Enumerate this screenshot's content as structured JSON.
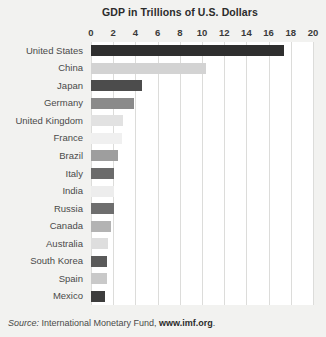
{
  "chart": {
    "title": "GDP in Trillions of U.S. Dollars",
    "source_prefix": "Source:",
    "source_text": " International Monetary Fund, ",
    "source_url": "www.imf.org",
    "source_suffix": "."
  },
  "chart_data": {
    "type": "bar",
    "orientation": "horizontal",
    "title": "GDP in Trillions of U.S. Dollars",
    "xlabel": "",
    "ylabel": "",
    "xlim": [
      0,
      20
    ],
    "xticks": [
      0,
      2,
      4,
      6,
      8,
      10,
      12,
      14,
      16,
      18,
      20
    ],
    "grid": true,
    "legend": "none",
    "unit": "Trillions of U.S. Dollars",
    "categories": [
      "United States",
      "China",
      "Japan",
      "Germany",
      "United Kingdom",
      "France",
      "Brazil",
      "Italy",
      "India",
      "Russia",
      "Canada",
      "Australia",
      "South Korea",
      "Spain",
      "Mexico"
    ],
    "values": [
      17.4,
      10.4,
      4.6,
      3.9,
      2.9,
      2.8,
      2.4,
      2.1,
      2.1,
      2.1,
      1.8,
      1.5,
      1.4,
      1.4,
      1.3
    ],
    "bar_colors": [
      "#2f2f2f",
      "#d3d3d3",
      "#4c4c4c",
      "#8a8a8a",
      "#e2e2e2",
      "#f0f0f0",
      "#9e9e9e",
      "#6b6b6b",
      "#ededed",
      "#6e6e6e",
      "#b3b3b3",
      "#dedede",
      "#5a5a5a",
      "#c9c9c9",
      "#3d3d3d"
    ],
    "annotations": [
      "Source: International Monetary Fund, www.imf.org."
    ]
  },
  "colors": {
    "background": "#f2f2f0",
    "plot_background": "#ffffff",
    "gridline": "#dcdcda",
    "title_text": "#2b2b2b",
    "label_text": "#4a4a4a"
  }
}
